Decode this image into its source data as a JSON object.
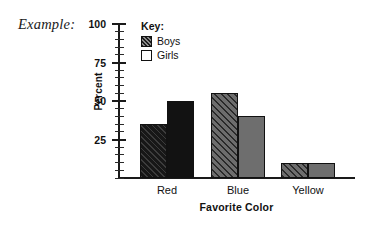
{
  "annotation": {
    "example_label": "Example:"
  },
  "chart_data": {
    "type": "bar",
    "title": "",
    "xlabel": "Favorite Color",
    "ylabel": "Percent",
    "categories": [
      "Red",
      "Blue",
      "Yellow"
    ],
    "series": [
      {
        "name": "Boys",
        "values": [
          35,
          55,
          10
        ],
        "fill": "hatched"
      },
      {
        "name": "Girls",
        "values": [
          50,
          40,
          10
        ],
        "fill": "solid"
      }
    ],
    "ylim": [
      0,
      100
    ],
    "y_tick_labels": [
      "100",
      "75",
      "50",
      "25"
    ],
    "y_tick_values": [
      100,
      75,
      50,
      25
    ],
    "y_major_interval": 25,
    "y_minor_interval": 5,
    "grid": false,
    "legend_title": "Key:",
    "legend_position": "inside-top-left",
    "colors": {
      "boys_red": "#171717",
      "girls_red": "#121212",
      "boys_blue": "#4e4e4e",
      "girls_blue": "#6e6e6e",
      "boys_yellow": "#4e4e4e",
      "girls_yellow": "#6e6e6e",
      "axis": "#1a1a1a",
      "background": "#ffffff"
    }
  },
  "legend": {
    "title": "Key:",
    "items": [
      {
        "label": "Boys",
        "swatch": "hatched-swatch"
      },
      {
        "label": "Girls",
        "swatch": "white-swatch"
      }
    ]
  }
}
